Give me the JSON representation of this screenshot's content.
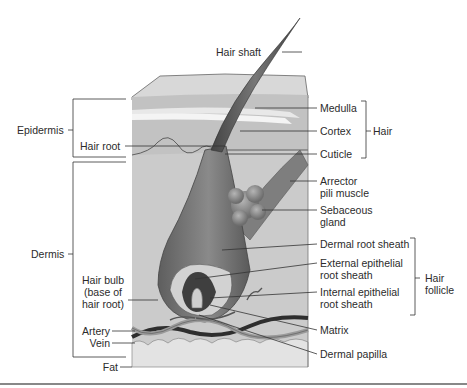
{
  "figure": {
    "labels": {
      "hair_shaft": "Hair shaft",
      "medulla": "Medulla",
      "cortex": "Cortex",
      "cuticle": "Cuticle",
      "hair": "Hair",
      "epidermis": "Epidermis",
      "hair_root": "Hair root",
      "dermis": "Dermis",
      "arrector_1": "Arrector",
      "arrector_2": "pili muscle",
      "sebaceous_1": "Sebaceous",
      "sebaceous_2": "gland",
      "dermal_root_sheath": "Dermal root sheath",
      "external_1": "External epithelial",
      "external_2": "root sheath",
      "internal_1": "Internal epithelial",
      "internal_2": "root sheath",
      "hair_follicle_1": "Hair",
      "hair_follicle_2": "follicle",
      "hair_bulb_1": "Hair bulb",
      "hair_bulb_2": "(base of",
      "hair_bulb_3": "hair root)",
      "artery": "Artery",
      "vein": "Vein",
      "matrix": "Matrix",
      "dermal_papilla": "Dermal papilla",
      "fat": "Fat"
    },
    "colors": {
      "skin_block": "#cfcfcf",
      "epidermis_band": "#bdbdbd",
      "hair_dark": "#5a5a5a",
      "follicle": "#7a7a7a",
      "gland": "#8d8d8d",
      "fat": "#e2e2e2",
      "leader_line": "#333333"
    }
  }
}
